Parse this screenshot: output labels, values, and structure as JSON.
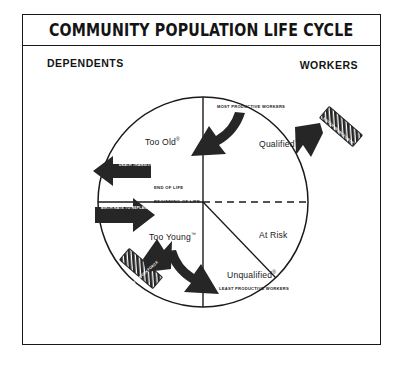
{
  "poster": {
    "title": "COMMUNITY POPULATION LIFE CYCLE",
    "headers": {
      "left": "DEPENDENTS",
      "right": "WORKERS"
    },
    "colors": {
      "ink": "#1a1a1a",
      "arrow_fill": "#262626",
      "paper": "#ffffff"
    }
  },
  "diagram": {
    "type": "cycle-quadrant-wheel",
    "quadrants": [
      {
        "id": "too-old",
        "label": "Too Old",
        "mark": "®",
        "position": "upper-left",
        "group": "DEPENDENTS"
      },
      {
        "id": "qualified",
        "label": "Qualified",
        "mark": "™",
        "position": "upper-right",
        "group": "WORKERS"
      },
      {
        "id": "too-young",
        "label": "Too Young",
        "mark": "™",
        "position": "lower-left",
        "group": "DEPENDENTS"
      },
      {
        "id": "at-risk",
        "label": "At Risk",
        "mark": "",
        "position": "lower-right",
        "group": "WORKERS"
      },
      {
        "id": "unqualified",
        "label": "Unqualified",
        "mark": "®",
        "position": "lower-center-right",
        "group": "WORKERS"
      }
    ],
    "annotations": {
      "most_productive": "MOST PRODUCTIVE WORKERS",
      "least_productive": "LEAST PRODUCTIVE WORKERS",
      "end_of_life": "END OF LIFE",
      "beginning_of_life": "BEGINNING OF LIFE"
    },
    "flow_arrows": [
      {
        "id": "death-transition",
        "label": "DEATH TRANSITION",
        "direction": "out-left",
        "style": "solid"
      },
      {
        "id": "birth-replace",
        "label": "BIRTH RATE TO REPLACE DEATH RATE",
        "direction": "in-left",
        "style": "solid"
      },
      {
        "id": "enter-workforce",
        "label": "ENTER WORKFORCE",
        "direction": "in-upper-right",
        "style": "hatched"
      },
      {
        "id": "exit-workforce",
        "label": "EXIT WORKFORCE",
        "direction": "out-lower-left",
        "style": "hatched"
      },
      {
        "id": "aging-upper",
        "label": "",
        "direction": "curve-upper",
        "style": "solid"
      },
      {
        "id": "aging-lower",
        "label": "",
        "direction": "curve-lower",
        "style": "solid"
      }
    ]
  }
}
